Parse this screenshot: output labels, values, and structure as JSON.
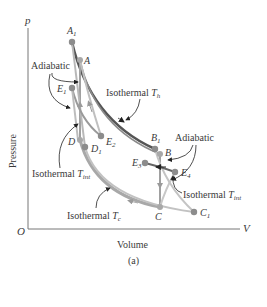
{
  "figure": {
    "caption": "(a)",
    "axes": {
      "y_symbol": "p",
      "x_symbol": "V",
      "origin": "O",
      "y_label": "Pressure",
      "x_label": "Volume"
    },
    "points": {
      "A1": {
        "base": "A",
        "sub": "1"
      },
      "A": {
        "base": "A",
        "sub": ""
      },
      "E1": {
        "base": "E",
        "sub": "1"
      },
      "E2": {
        "base": "E",
        "sub": "2"
      },
      "D": {
        "base": "D",
        "sub": ""
      },
      "D1": {
        "base": "D",
        "sub": "1"
      },
      "B1": {
        "base": "B",
        "sub": "1"
      },
      "B": {
        "base": "B",
        "sub": ""
      },
      "E3": {
        "base": "E",
        "sub": "3"
      },
      "E4": {
        "base": "E",
        "sub": "4"
      },
      "C": {
        "base": "C",
        "sub": ""
      },
      "C1": {
        "base": "C",
        "sub": "1"
      }
    },
    "annotations": {
      "adiabatic_left": "Adiabatic",
      "adiabatic_right": "Adiabatic",
      "isothermal_th": {
        "text": "Isothermal",
        "sym": "T",
        "sub": "h"
      },
      "isothermal_tint_left": {
        "text": "Isothermal",
        "sym": "T",
        "sub": "int"
      },
      "isothermal_tint_right": {
        "text": "Isothermal",
        "sym": "T",
        "sub": "int"
      },
      "isothermal_tc": {
        "text": "Isothermal",
        "sym": "T",
        "sub": "c"
      }
    },
    "colors": {
      "hot_isotherm": "#555555",
      "cycle_light": "#b5b5b5",
      "cycle_mid": "#9a9a9a",
      "point": "#8c8c8c",
      "axis": "#777777"
    }
  }
}
